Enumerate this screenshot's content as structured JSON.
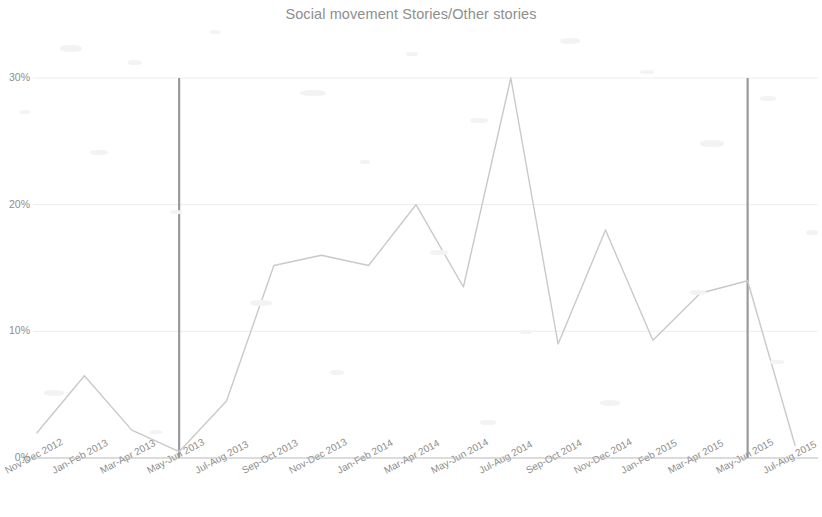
{
  "chart_data": {
    "type": "line",
    "title": "Social movement Stories/Other stories",
    "xlabel": "",
    "ylabel": "",
    "ylim": [
      0,
      30
    ],
    "yticks": [
      0,
      10,
      20,
      30
    ],
    "ytick_labels": [
      "0%",
      "10%",
      "20%",
      "30%"
    ],
    "grid": true,
    "legend": "none",
    "categories": [
      "Nov-Dec 2012",
      "Jan-Feb 2013",
      "Mar-Apr 2013",
      "May-Jun 2013",
      "Jul-Aug 2013",
      "Sep-Oct 2013",
      "Nov-Dec 2013",
      "Jan-Feb 2014",
      "Mar-Apr 2014",
      "May-Jun 2014",
      "Jul-Aug 2014",
      "Sep-Oct 2014",
      "Nov-Dec 2014",
      "Jan-Feb 2015",
      "Mar-Apr 2015",
      "May-Jun 2015",
      "Jul-Aug 2015"
    ],
    "series": [
      {
        "name": "Social movement Stories/Other stories",
        "color": "#c9c9c9",
        "values": [
          2.0,
          6.5,
          2.2,
          0.5,
          4.5,
          15.2,
          16.0,
          15.2,
          20.0,
          13.5,
          30.0,
          9.0,
          18.0,
          9.3,
          13.0,
          14.0,
          1.0
        ]
      }
    ],
    "annotations": [
      {
        "type": "vertical-line",
        "name": "marker-line-may-jun-2013",
        "at_category": "May-Jun 2013",
        "color": "#9a9a9a"
      },
      {
        "type": "vertical-line",
        "name": "marker-line-may-jun-2015",
        "at_category": "May-Jun 2015",
        "color": "#9a9a9a"
      }
    ]
  }
}
